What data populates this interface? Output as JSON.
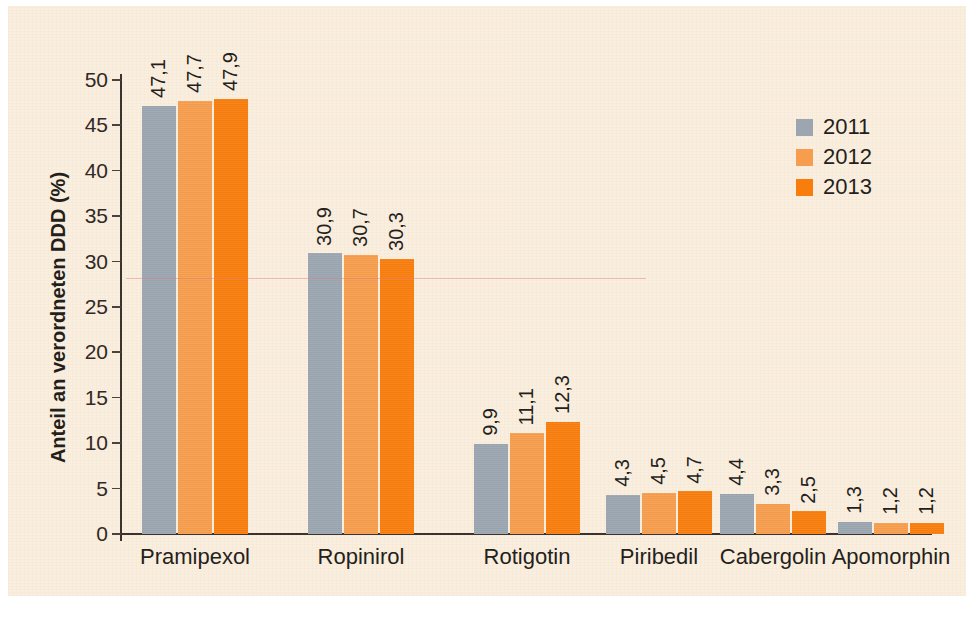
{
  "chart_data": {
    "type": "bar",
    "title": "",
    "xlabel": "",
    "ylabel": "Anteil an verordneten DDD (%)",
    "ylim": [
      0,
      50
    ],
    "ytick_labels": [
      "0",
      "5",
      "10",
      "15",
      "20",
      "25",
      "30",
      "35",
      "40",
      "45",
      "50"
    ],
    "ytick_values": [
      0,
      5,
      10,
      15,
      20,
      25,
      30,
      35,
      40,
      45,
      50
    ],
    "grid": false,
    "legend_position": "top-right",
    "categories": [
      "Pramipexol",
      "Ropinirol",
      "Rotigotin",
      "Piribedil",
      "Cabergolin",
      "Apomorphin"
    ],
    "series": [
      {
        "name": "2011",
        "color": "#9ba6b0",
        "values": [
          47.1,
          30.9,
          9.9,
          4.3,
          4.4,
          1.3
        ],
        "value_labels": [
          "47,1",
          "30,9",
          "9,9",
          "4,3",
          "4,4",
          "1,3"
        ]
      },
      {
        "name": "2012",
        "color": "#f79d4e",
        "values": [
          47.7,
          30.7,
          11.1,
          4.5,
          3.3,
          1.2
        ],
        "value_labels": [
          "47,7",
          "30,7",
          "11,1",
          "4,5",
          "3,3",
          "1,2"
        ]
      },
      {
        "name": "2013",
        "color": "#f97d0d",
        "values": [
          47.9,
          30.3,
          12.3,
          4.7,
          2.5,
          1.2
        ],
        "value_labels": [
          "47,9",
          "30,3",
          "12,3",
          "4,7",
          "2,5",
          "1,2"
        ]
      }
    ]
  },
  "legend": {
    "items": [
      {
        "label": "2011",
        "color": "#9ba6b0"
      },
      {
        "label": "2012",
        "color": "#f79d4e"
      },
      {
        "label": "2013",
        "color": "#f97d0d"
      }
    ]
  },
  "colors": {
    "background": "#faeede",
    "axis": "#3a3330",
    "text": "#241f1c",
    "series_2011": "#9ba6b0",
    "series_2012": "#f79d4e",
    "series_2013": "#f97d0d"
  }
}
